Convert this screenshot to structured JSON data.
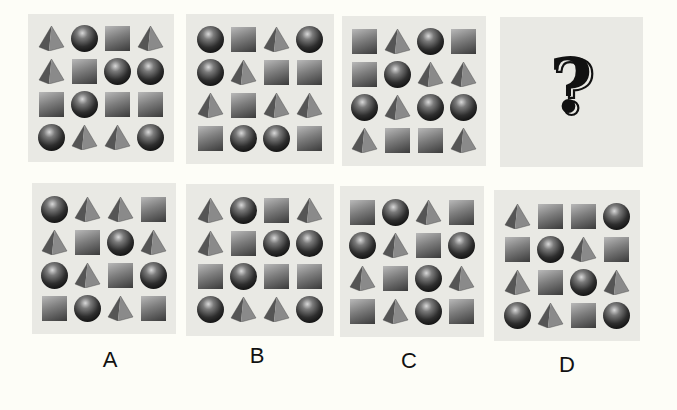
{
  "puzzle": {
    "legend": {
      "S": "sphere",
      "Q": "square",
      "P": "pyramid"
    },
    "question_mark": "?",
    "sequence": [
      {
        "id": "panel-1",
        "grid": [
          [
            "P",
            "S",
            "Q",
            "P"
          ],
          [
            "P",
            "Q",
            "S",
            "S"
          ],
          [
            "Q",
            "S",
            "Q",
            "Q"
          ],
          [
            "S",
            "P",
            "P",
            "S"
          ]
        ]
      },
      {
        "id": "panel-2",
        "grid": [
          [
            "S",
            "Q",
            "P",
            "S"
          ],
          [
            "S",
            "P",
            "Q",
            "Q"
          ],
          [
            "P",
            "Q",
            "P",
            "P"
          ],
          [
            "Q",
            "S",
            "S",
            "Q"
          ]
        ]
      },
      {
        "id": "panel-3",
        "grid": [
          [
            "Q",
            "P",
            "S",
            "Q"
          ],
          [
            "Q",
            "S",
            "P",
            "P"
          ],
          [
            "S",
            "P",
            "S",
            "S"
          ],
          [
            "P",
            "Q",
            "Q",
            "P"
          ]
        ]
      },
      {
        "id": "panel-4",
        "grid": null,
        "placeholder": "?"
      }
    ],
    "options": [
      {
        "label": "A",
        "grid": [
          [
            "S",
            "P",
            "P",
            "Q"
          ],
          [
            "P",
            "Q",
            "S",
            "P"
          ],
          [
            "S",
            "P",
            "Q",
            "S"
          ],
          [
            "Q",
            "S",
            "P",
            "Q"
          ]
        ]
      },
      {
        "label": "B",
        "grid": [
          [
            "P",
            "S",
            "Q",
            "P"
          ],
          [
            "P",
            "Q",
            "S",
            "S"
          ],
          [
            "Q",
            "S",
            "Q",
            "Q"
          ],
          [
            "S",
            "P",
            "P",
            "S"
          ]
        ]
      },
      {
        "label": "C",
        "grid": [
          [
            "Q",
            "S",
            "P",
            "Q"
          ],
          [
            "S",
            "P",
            "Q",
            "S"
          ],
          [
            "P",
            "Q",
            "S",
            "P"
          ],
          [
            "Q",
            "P",
            "S",
            "Q"
          ]
        ]
      },
      {
        "label": "D",
        "grid": [
          [
            "P",
            "Q",
            "Q",
            "S"
          ],
          [
            "Q",
            "S",
            "P",
            "Q"
          ],
          [
            "P",
            "Q",
            "S",
            "P"
          ],
          [
            "S",
            "P",
            "Q",
            "S"
          ]
        ]
      }
    ]
  },
  "colors": {
    "page_bg": "#fdfdf7",
    "panel_bg": "#e9e9e4",
    "shape_dark": "#1a1a1a"
  }
}
